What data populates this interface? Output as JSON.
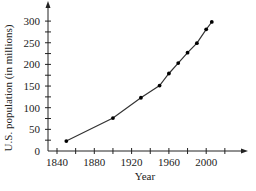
{
  "chart_data": {
    "type": "line",
    "title": "",
    "xlabel": "Year",
    "ylabel": "U.S. population (in millions)",
    "x": [
      1850,
      1900,
      1930,
      1950,
      1960,
      1970,
      1980,
      1990,
      2000,
      2006
    ],
    "series": [
      {
        "name": "U.S. population",
        "values": [
          23,
          76,
          123,
          151,
          179,
          203,
          227,
          249,
          281,
          298
        ]
      }
    ],
    "xlim": [
      1830,
      2040
    ],
    "ylim": [
      0,
      320
    ],
    "x_ticks": [
      1840,
      1860,
      1880,
      1900,
      1920,
      1940,
      1960,
      1980,
      2000,
      2020
    ],
    "x_tick_labels": [
      "1840",
      "1880",
      "1920",
      "1960",
      "2000"
    ],
    "x_tick_label_values": [
      1840,
      1880,
      1920,
      1960,
      2000
    ],
    "y_ticks": [
      25,
      50,
      75,
      100,
      125,
      150,
      175,
      200,
      225,
      250,
      275,
      300
    ],
    "y_tick_labels": [
      "0",
      "50",
      "100",
      "150",
      "200",
      "250",
      "300"
    ],
    "y_tick_label_values": [
      0,
      50,
      100,
      150,
      200,
      250,
      300
    ],
    "grid": false,
    "legend": "none",
    "markers": true,
    "colors": {
      "line": "#333333",
      "axis": "#222222",
      "text": "#222222"
    }
  }
}
